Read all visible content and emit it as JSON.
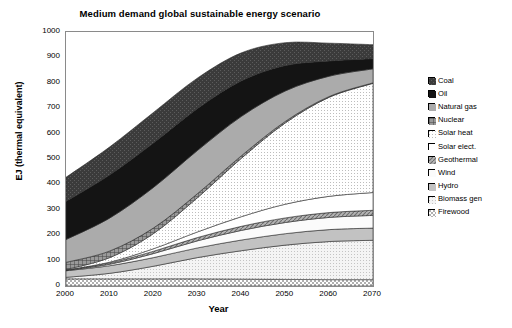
{
  "chart_data": {
    "type": "area",
    "title": "Medium demand global sustainable energy scenario",
    "xlabel": "Year",
    "ylabel": "EJ (thermal equivalent)",
    "xlim": [
      2000,
      2070
    ],
    "ylim": [
      0,
      1000
    ],
    "grid": false,
    "stacked": true,
    "legend_position": "right",
    "x": [
      2000,
      2010,
      2020,
      2030,
      2040,
      2050,
      2060,
      2070
    ],
    "xticks": [
      "2000",
      "2010",
      "2020",
      "2030",
      "2040",
      "2050",
      "2060",
      "2070"
    ],
    "yticks": [
      "0",
      "100",
      "200",
      "300",
      "400",
      "500",
      "600",
      "700",
      "800",
      "900",
      "1000"
    ],
    "stack_order_bottom_to_top": [
      "Firewood",
      "Biomass gen",
      "Hydro",
      "Wind",
      "Geothermal",
      "Solar elect.",
      "Solar heat",
      "Nuclear",
      "Natural gas",
      "Oil",
      "Coal"
    ],
    "series": [
      {
        "name": "Firewood",
        "fill": "#d8d8d8",
        "pattern": "checker",
        "values": [
          28,
          28,
          28,
          28,
          27,
          26,
          25,
          25
        ]
      },
      {
        "name": "Biomass gen",
        "fill": "#ececec",
        "pattern": "light-dots",
        "values": [
          6,
          22,
          50,
          84,
          112,
          135,
          150,
          155
        ]
      },
      {
        "name": "Hydro",
        "fill": "#bfbfbf",
        "pattern": "solid-mid",
        "values": [
          26,
          30,
          34,
          38,
          42,
          45,
          47,
          48
        ]
      },
      {
        "name": "Wind",
        "fill": "#f2f2f2",
        "pattern": "open",
        "values": [
          1,
          6,
          16,
          28,
          38,
          44,
          48,
          50
        ]
      },
      {
        "name": "Geothermal",
        "fill": "#9e9e9e",
        "pattern": "hatch",
        "values": [
          2,
          5,
          9,
          13,
          16,
          18,
          19,
          20
        ]
      },
      {
        "name": "Solar elect.",
        "fill": "#ffffff",
        "pattern": "white",
        "values": [
          0,
          3,
          10,
          22,
          38,
          54,
          64,
          70
        ]
      },
      {
        "name": "Solar heat",
        "fill": "#e4e4e4",
        "pattern": "fine-dots",
        "values": [
          2,
          18,
          60,
          135,
          230,
          320,
          390,
          430
        ]
      },
      {
        "name": "Nuclear",
        "fill": "#8f8f8f",
        "pattern": "dark-grid",
        "values": [
          28,
          26,
          22,
          16,
          10,
          6,
          3,
          2
        ]
      },
      {
        "name": "Natural gas",
        "fill": "#a8a8a8",
        "pattern": "solid-grey",
        "values": [
          90,
          130,
          160,
          170,
          155,
          120,
          80,
          55
        ]
      },
      {
        "name": "Oil",
        "fill": "#1c1c1c",
        "pattern": "near-black",
        "values": [
          150,
          170,
          175,
          165,
          140,
          100,
          60,
          40
        ]
      },
      {
        "name": "Coal",
        "fill": "#3a3a3a",
        "pattern": "dark-hatch",
        "values": [
          95,
          110,
          120,
          120,
          110,
          90,
          70,
          55
        ]
      }
    ],
    "totals": [
      428,
      548,
      684,
      819,
      918,
      958,
      956,
      950
    ]
  },
  "legend": {
    "items": [
      {
        "label": "Coal"
      },
      {
        "label": "Oil"
      },
      {
        "label": "Natural gas"
      },
      {
        "label": "Nuclear"
      },
      {
        "label": "Solar heat"
      },
      {
        "label": "Solar elect."
      },
      {
        "label": "Geothermal"
      },
      {
        "label": "Wind"
      },
      {
        "label": "Hydro"
      },
      {
        "label": "Biomass gen"
      },
      {
        "label": "Firewood"
      }
    ]
  }
}
